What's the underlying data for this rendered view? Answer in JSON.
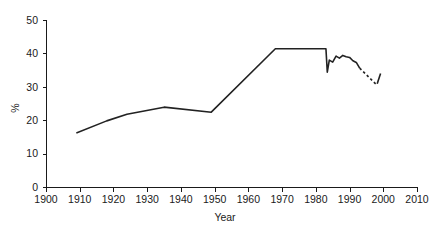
{
  "chart_data": {
    "type": "line",
    "title": "",
    "subtitle": "",
    "xlabel": "Year",
    "ylabel": "%",
    "xlim": [
      1900,
      2010
    ],
    "ylim": [
      0,
      50
    ],
    "xticks": [
      1900,
      1910,
      1920,
      1930,
      1940,
      1950,
      1960,
      1970,
      1980,
      1990,
      2000,
      2010
    ],
    "yticks": [
      0,
      10,
      20,
      30,
      40,
      50
    ],
    "xtick_labels": [
      "1900",
      "1910",
      "1920",
      "1930",
      "1940",
      "1950",
      "1960",
      "1970",
      "1980",
      "1990",
      "2000",
      "2010"
    ],
    "ytick_labels": [
      "0",
      "10",
      "20",
      "30",
      "40",
      "50"
    ],
    "grid": false,
    "legend": false,
    "legend_position": "none",
    "line_color": "#222222",
    "series": [
      {
        "name": "main",
        "style": "solid",
        "points": [
          [
            1909,
            16.2
          ],
          [
            1918,
            19.8
          ],
          [
            1924,
            21.8
          ],
          [
            1935,
            23.9
          ],
          [
            1949,
            22.4
          ],
          [
            1968,
            41.4
          ],
          [
            1983,
            41.4
          ],
          [
            1983.4,
            34.4
          ],
          [
            1984,
            38.0
          ],
          [
            1985,
            37.4
          ],
          [
            1986,
            39.2
          ],
          [
            1987,
            38.6
          ],
          [
            1988,
            39.4
          ],
          [
            1989,
            39.0
          ],
          [
            1990,
            38.8
          ],
          [
            1991,
            37.8
          ],
          [
            1992,
            37.3
          ],
          [
            1993,
            35.6
          ]
        ]
      },
      {
        "name": "projection",
        "style": "dashed",
        "points": [
          [
            1993,
            35.6
          ],
          [
            1998,
            30.6
          ]
        ]
      },
      {
        "name": "final-uptick",
        "style": "solid",
        "points": [
          [
            1998.2,
            30.9
          ],
          [
            1999.2,
            34.0
          ]
        ]
      }
    ]
  },
  "axes": {
    "plot_left_px": 46,
    "plot_right_px": 417,
    "plot_top_px": 20,
    "plot_bottom_px": 187
  }
}
